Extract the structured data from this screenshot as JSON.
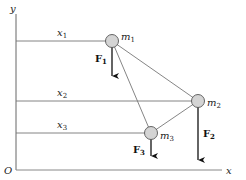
{
  "diagram": {
    "axes": {
      "x_label": "x",
      "y_label": "y",
      "origin_label": "O"
    },
    "distances": [
      {
        "label": "x",
        "sub": "1"
      },
      {
        "label": "x",
        "sub": "2"
      },
      {
        "label": "x",
        "sub": "3"
      }
    ],
    "masses": [
      {
        "label": "m",
        "sub": "1"
      },
      {
        "label": "m",
        "sub": "2"
      },
      {
        "label": "m",
        "sub": "3"
      }
    ],
    "forces": [
      {
        "label": "F",
        "sub": "1"
      },
      {
        "label": "F",
        "sub": "2"
      },
      {
        "label": "F",
        "sub": "3"
      }
    ],
    "colors": {
      "line": "#777777",
      "axis": "#666666",
      "mass_fill": "#d4d4d4",
      "mass_stroke": "#555555",
      "arrow": "#111111"
    }
  }
}
